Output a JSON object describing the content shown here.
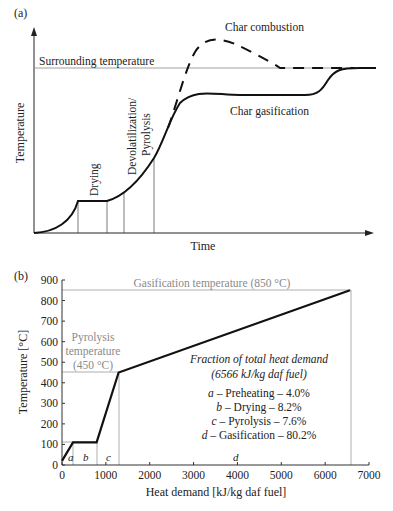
{
  "chart_data": [
    {
      "panel": "(a)",
      "type": "line",
      "title": "",
      "xlabel": "Time",
      "ylabel": "Temperature",
      "grid": false,
      "reference_lines": [
        {
          "label": "Surrounding temperature",
          "orientation": "horizontal"
        }
      ],
      "stage_labels": [
        "Drying",
        "Devolatilization/ Pyrolysis"
      ],
      "series": [
        {
          "name": "Char gasification",
          "style": "solid",
          "description": "Rises from zero, plateau during drying, S-rise through devolatilization/pyrolysis, plateau below surrounding temperature, final rise to surrounding temperature"
        },
        {
          "name": "Char combustion",
          "style": "dashed",
          "description": "Branches from pyrolysis rise, overshoots above surrounding temperature, then returns to surrounding temperature"
        }
      ]
    },
    {
      "panel": "(b)",
      "type": "line",
      "title": "",
      "xlabel": "Heat demand [kJ/kg daf fuel]",
      "ylabel": "Temperature [°C]",
      "xlim": [
        0,
        7000
      ],
      "ylim": [
        0,
        900
      ],
      "xticks": [
        0,
        1000,
        2000,
        3000,
        4000,
        5000,
        6000,
        7000
      ],
      "yticks": [
        0,
        100,
        200,
        300,
        400,
        500,
        600,
        700,
        800,
        900
      ],
      "grid": false,
      "series": [
        {
          "name": "Heat demand curve",
          "x": [
            0,
            250,
            790,
            1290,
            6566
          ],
          "y": [
            20,
            110,
            110,
            450,
            850
          ]
        }
      ],
      "reference_lines": [
        {
          "label": "Gasification temperature (850 °C)",
          "y": 850
        },
        {
          "label": "Pyrolysis temperature (450 °C)",
          "y": 450
        },
        {
          "label": "",
          "y": 110
        }
      ],
      "segments": [
        {
          "letter": "a",
          "name": "Preheating",
          "percent": 4.0,
          "x_end": 250
        },
        {
          "letter": "b",
          "name": "Drying",
          "percent": 8.2,
          "x_end": 790
        },
        {
          "letter": "c",
          "name": "Pyrolysis",
          "percent": 7.6,
          "x_end": 1290
        },
        {
          "letter": "d",
          "name": "Gasification",
          "percent": 80.2,
          "x_end": 6566
        }
      ],
      "annotation": {
        "title": "Fraction of total heat demand",
        "subtitle": "(6566 kJ/kg daf fuel)",
        "lines": [
          "a – Preheating – 4.0%",
          "b – Drying – 8.2%",
          "c – Pyrolysis – 7.6%",
          "d – Gasification – 80.2%"
        ]
      }
    }
  ],
  "labels": {
    "panel_a": "(a)",
    "panel_b": "(b)",
    "a_ylabel": "Temperature",
    "a_xlabel": "Time",
    "a_surrounding": "Surrounding temperature",
    "a_combustion": "Char combustion",
    "a_gasification": "Char gasification",
    "a_drying": "Drying",
    "a_devol_1": "Devolatilization/",
    "a_devol_2": "Pyrolysis",
    "b_ylabel": "Temperature [°C]",
    "b_xlabel": "Heat demand [kJ/kg daf fuel]",
    "b_gasif_temp": "Gasification temperature (850 °C)",
    "b_pyro_1": "Pyrolysis",
    "b_pyro_2": "temperature",
    "b_pyro_3": "(450 °C)",
    "ann_title": "Fraction of total heat demand",
    "ann_sub": "(6566 kJ/kg daf fuel)",
    "ann_a_letter": "a",
    "ann_a_text": " – Preheating – 4.0%",
    "ann_b_letter": "b",
    "ann_b_text": " – Drying – 8.2%",
    "ann_c_letter": "c",
    "ann_c_text": " – Pyrolysis – 7.6%",
    "ann_d_letter": "d",
    "ann_d_text": " – Gasification – 80.2%",
    "seg_a": "a",
    "seg_b": "b",
    "seg_c": "c",
    "seg_d": "d"
  },
  "colors": {
    "line": "#111111",
    "axis": "#333333",
    "reference": "#9a9a9a",
    "gray_text": "#8a8a8a"
  }
}
